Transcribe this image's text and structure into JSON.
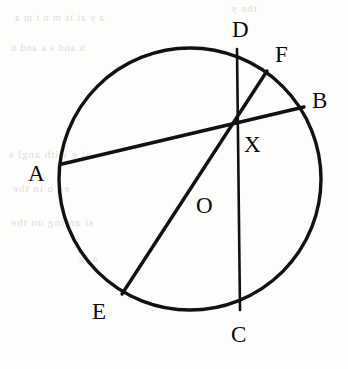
{
  "figure": {
    "kind": "circle-geometry-diagram",
    "stroke_color": "#111111",
    "background_color": "#fdfdfc",
    "canvas": {
      "width": 348,
      "height": 369
    },
    "circle": {
      "cx": 190,
      "cy": 179,
      "r": 131,
      "stroke_width": 3.4
    },
    "labels": [
      {
        "name": "label-D",
        "text": "D",
        "x": 232,
        "y": 18
      },
      {
        "name": "label-F",
        "text": "F",
        "x": 275,
        "y": 43
      },
      {
        "name": "label-B",
        "text": "B",
        "x": 312,
        "y": 89
      },
      {
        "name": "label-X",
        "text": "X",
        "x": 244,
        "y": 133
      },
      {
        "name": "label-A",
        "text": "A",
        "x": 28,
        "y": 162
      },
      {
        "name": "label-O",
        "text": "O",
        "x": 196,
        "y": 194
      },
      {
        "name": "label-E",
        "text": "E",
        "x": 92,
        "y": 300
      },
      {
        "name": "label-C",
        "text": "C",
        "x": 231,
        "y": 323
      }
    ],
    "points": [
      {
        "name": "point-X",
        "text": "X",
        "x": 238,
        "y": 126,
        "on_circle": false,
        "note": "common intersection of all chords"
      },
      {
        "name": "point-D",
        "text": "D",
        "x": 237,
        "y": 49,
        "on_circle": true
      },
      {
        "name": "point-F",
        "text": "F",
        "x": 267,
        "y": 71,
        "on_circle": true
      },
      {
        "name": "point-B",
        "text": "B",
        "x": 304,
        "y": 107,
        "on_circle": true
      },
      {
        "name": "point-A",
        "text": "A",
        "x": 62,
        "y": 164,
        "on_circle": true
      },
      {
        "name": "point-O",
        "text": "O",
        "x": 196,
        "y": 202,
        "on_circle": false,
        "note": "labelled point on segment EX"
      },
      {
        "name": "point-E",
        "text": "E",
        "x": 122,
        "y": 294,
        "on_circle": true
      },
      {
        "name": "point-C",
        "text": "C",
        "x": 240,
        "y": 310,
        "on_circle": true
      }
    ],
    "segments": [
      {
        "name": "chord-A-B",
        "from": "A",
        "to": "B",
        "x1": 62,
        "y1": 164,
        "x2": 304,
        "y2": 107,
        "stroke_width": 3.4
      },
      {
        "name": "chord-D-C",
        "from": "D",
        "to": "C",
        "x1": 237,
        "y1": 49,
        "x2": 240,
        "y2": 310,
        "stroke_width": 2.6
      },
      {
        "name": "chord-E-F",
        "from": "E",
        "to": "F",
        "x1": 122,
        "y1": 294,
        "x2": 267,
        "y2": 71,
        "stroke_width": 3.4
      }
    ],
    "bleed_text": [
      {
        "name": "bleed-row-1",
        "text": "the y",
        "x": 230,
        "y": 2,
        "size": 11
      },
      {
        "name": "bleed-row-2",
        "text": "a y  ai    is m n t  m a",
        "x": 14,
        "y": 12,
        "size": 10
      },
      {
        "name": "bleed-row-3",
        "text": "n   and   s   a  and  n",
        "x": 10,
        "y": 42,
        "size": 10
      },
      {
        "name": "bleed-row-4",
        "text": "oi  e   with  angl   s",
        "x": 8,
        "y": 148,
        "size": 11
      },
      {
        "name": "bleed-row-5",
        "text": "en    o     in  the",
        "x": 12,
        "y": 182,
        "size": 11
      },
      {
        "name": "bleed-row-6",
        "text": "si  an ing  on the",
        "x": 10,
        "y": 216,
        "size": 11
      },
      {
        "name": "bleed-row-7",
        "text": "a ie",
        "x": 78,
        "y": 252,
        "size": 11
      }
    ]
  }
}
